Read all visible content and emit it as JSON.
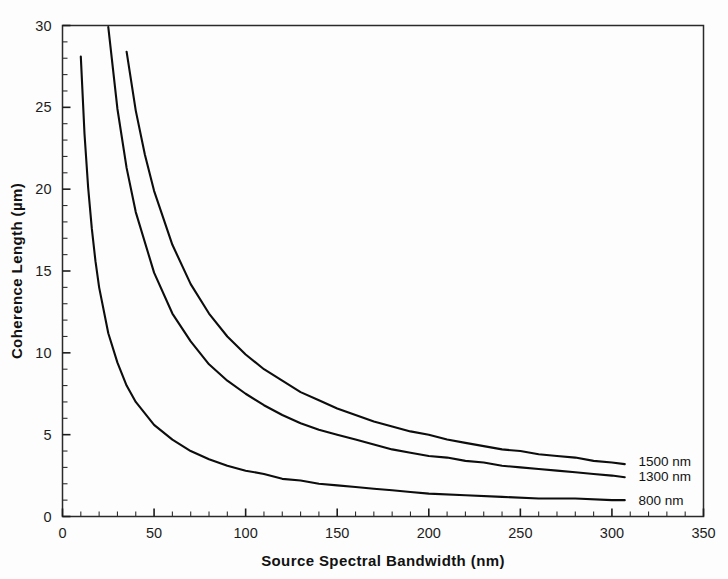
{
  "chart_data": {
    "type": "line",
    "title": "",
    "xlabel": "Source Spectral Bandwidth (nm)",
    "ylabel": "Coherence Length (µm)",
    "xlim": [
      0,
      350
    ],
    "ylim": [
      0,
      30
    ],
    "xticks": [
      0,
      50,
      100,
      150,
      200,
      250,
      300,
      350
    ],
    "xtick_labels": [
      "0",
      "50",
      "100",
      "150",
      "200",
      "250",
      "300",
      "350"
    ],
    "yticks": [
      0,
      5,
      10,
      15,
      20,
      25,
      30
    ],
    "ytick_labels": [
      "0",
      "5",
      "10",
      "15",
      "20",
      "25",
      "30"
    ],
    "x_minor_step": 10,
    "y_minor_step": 1,
    "grid": false,
    "legend_position": "right-inline",
    "relation": "Lc = (2*ln2/pi) * lambda^2 / delta_lambda",
    "series": [
      {
        "name": "1500 nm",
        "label": "1500 nm",
        "lambda_nm": 1500,
        "color": "#0d0d0d",
        "label_x": 309,
        "label_y": 3.4,
        "x": [
          35,
          40,
          45,
          50,
          60,
          70,
          80,
          90,
          100,
          110,
          120,
          130,
          140,
          150,
          160,
          170,
          180,
          190,
          200,
          210,
          220,
          230,
          240,
          250,
          260,
          270,
          280,
          290,
          300,
          307
        ],
        "y": [
          28.4,
          24.8,
          22.1,
          19.9,
          16.6,
          14.2,
          12.4,
          11.0,
          9.9,
          9.0,
          8.3,
          7.6,
          7.1,
          6.6,
          6.2,
          5.8,
          5.5,
          5.2,
          5.0,
          4.7,
          4.5,
          4.3,
          4.1,
          4.0,
          3.8,
          3.7,
          3.6,
          3.4,
          3.3,
          3.2
        ]
      },
      {
        "name": "1300 nm",
        "label": "1300 nm",
        "lambda_nm": 1300,
        "color": "#0d0d0d",
        "label_x": 309,
        "label_y": 2.5,
        "x": [
          25,
          30,
          35,
          40,
          50,
          60,
          70,
          80,
          90,
          100,
          110,
          120,
          130,
          140,
          150,
          160,
          170,
          180,
          190,
          200,
          210,
          220,
          230,
          240,
          250,
          260,
          270,
          280,
          290,
          300,
          307
        ],
        "y": [
          29.9,
          24.9,
          21.3,
          18.6,
          14.9,
          12.4,
          10.7,
          9.3,
          8.3,
          7.5,
          6.8,
          6.2,
          5.7,
          5.3,
          5.0,
          4.7,
          4.4,
          4.1,
          3.9,
          3.7,
          3.6,
          3.4,
          3.3,
          3.1,
          3.0,
          2.9,
          2.8,
          2.7,
          2.6,
          2.5,
          2.4
        ]
      },
      {
        "name": "800 nm",
        "label": "800 nm",
        "lambda_nm": 800,
        "color": "#0d0d0d",
        "label_x": 309,
        "label_y": 1.0,
        "x": [
          10,
          12,
          14,
          16,
          18,
          20,
          25,
          30,
          35,
          40,
          50,
          60,
          70,
          80,
          90,
          100,
          110,
          120,
          130,
          140,
          150,
          160,
          170,
          180,
          190,
          200,
          220,
          240,
          260,
          280,
          300,
          307
        ],
        "y": [
          28.1,
          23.4,
          20.1,
          17.6,
          15.6,
          14.0,
          11.2,
          9.4,
          8.0,
          7.0,
          5.6,
          4.7,
          4.0,
          3.5,
          3.1,
          2.8,
          2.6,
          2.3,
          2.2,
          2.0,
          1.9,
          1.8,
          1.7,
          1.6,
          1.5,
          1.4,
          1.3,
          1.2,
          1.1,
          1.1,
          1.0,
          1.0
        ]
      }
    ]
  }
}
